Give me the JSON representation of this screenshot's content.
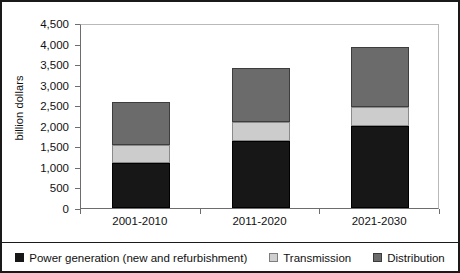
{
  "chart_data": {
    "type": "bar",
    "subtype": "stacked-bar",
    "title": "",
    "xlabel": "",
    "ylabel": "billion dollars",
    "categories": [
      "2001-2010",
      "2011-2020",
      "2021-2030"
    ],
    "ylim": [
      0,
      4500
    ],
    "ytick_step": 500,
    "ytick_labels": [
      "0",
      "500",
      "1,000",
      "1,500",
      "2,000",
      "2,500",
      "3,000",
      "3,500",
      "4,000",
      "4,500"
    ],
    "ytick_values": [
      0,
      500,
      1000,
      1500,
      2000,
      2500,
      3000,
      3500,
      4000,
      4500
    ],
    "grid": false,
    "legend_position": "bottom",
    "series": [
      {
        "name": "Power generation (new and refurbishment)",
        "color": "#171717",
        "values": [
          1100,
          1620,
          2000
        ]
      },
      {
        "name": "Transmission",
        "color": "#cccccc",
        "values": [
          430,
          480,
          450
        ]
      },
      {
        "name": "Distribution",
        "color": "#6b6b6b",
        "values": [
          1050,
          1300,
          1470
        ]
      }
    ],
    "totals": [
      2580,
      3400,
      3920
    ]
  },
  "axis": {
    "y_title": "billion dollars"
  },
  "legend": {
    "items": [
      {
        "label": "Power generation (new and refurbishment)",
        "swatch": "black-square-icon"
      },
      {
        "label": "Transmission",
        "swatch": "light-gray-square-icon"
      },
      {
        "label": "Distribution",
        "swatch": "dark-gray-square-icon"
      }
    ]
  }
}
